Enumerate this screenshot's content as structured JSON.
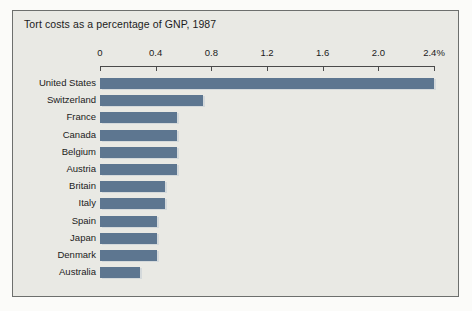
{
  "chart_data": {
    "type": "bar",
    "orientation": "horizontal",
    "title": "Tort costs as a percentage of GNP, 1987",
    "xlabel": "",
    "ylabel": "",
    "xlim": [
      0,
      2.4
    ],
    "grid": false,
    "legend": null,
    "tick_labels": [
      "0",
      "0.4",
      "0.8",
      "1.2",
      "1.6",
      "2.0",
      "2.4%"
    ],
    "tick_values": [
      0,
      0.4,
      0.8,
      1.2,
      1.6,
      2.0,
      2.4
    ],
    "categories": [
      "United States",
      "Switzerland",
      "France",
      "Canada",
      "Belgium",
      "Austria",
      "Britain",
      "Italy",
      "Spain",
      "Japan",
      "Denmark",
      "Australia"
    ],
    "values": [
      2.4,
      0.74,
      0.55,
      0.55,
      0.55,
      0.55,
      0.47,
      0.47,
      0.41,
      0.41,
      0.41,
      0.29
    ],
    "series": [
      {
        "name": "Tort costs as a percentage of GNP",
        "values": [
          2.4,
          0.74,
          0.55,
          0.55,
          0.55,
          0.55,
          0.47,
          0.47,
          0.41,
          0.41,
          0.41,
          0.29
        ]
      }
    ],
    "colors": {
      "bar": "#5d7690",
      "bar_shadow": "#c3ccd3",
      "plot_background": "#e9e9e4",
      "frame_border": "#6d6f6d",
      "axis": "#4a4a4a",
      "text": "#1b1b1b",
      "page_background": "#fbfbf9"
    }
  }
}
